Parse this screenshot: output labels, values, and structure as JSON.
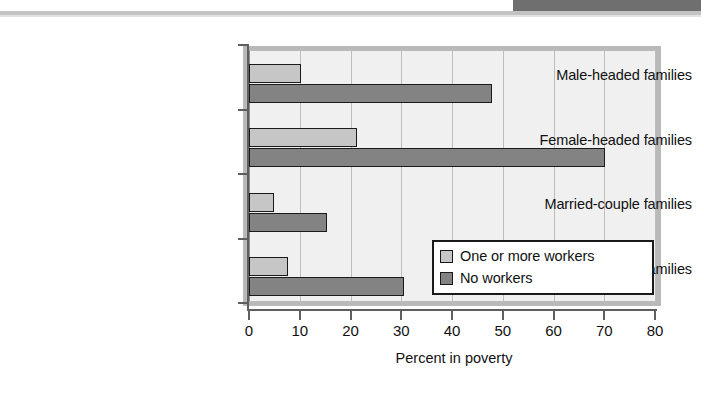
{
  "decor": {
    "top_band_color": "#6f6f6f",
    "rule_color": "#c3c3c3"
  },
  "chart_data": {
    "type": "bar",
    "orientation": "horizontal",
    "title": "",
    "xlabel": "Percent in poverty",
    "ylabel": "",
    "xlim": [
      0,
      80
    ],
    "xticks": [
      0,
      10,
      20,
      30,
      40,
      50,
      60,
      70,
      80
    ],
    "xtick_labels": [
      "0",
      "10",
      "20",
      "30",
      "40",
      "50",
      "60",
      "70",
      "80"
    ],
    "grid": true,
    "grid_axis": "x",
    "legend_position": "lower right",
    "categories": [
      "Male-headed families",
      "Female-headed families",
      "Married-couple families",
      "All families"
    ],
    "series": [
      {
        "name": "One or more workers",
        "color": "#c6c6c6",
        "values": [
          10.3,
          21.3,
          4.9,
          7.7
        ]
      },
      {
        "name": "No workers",
        "color": "#838383",
        "values": [
          47.9,
          70.1,
          15.4,
          30.5
        ]
      }
    ]
  },
  "legend": {
    "entries": [
      {
        "label": "One or more workers",
        "swatch": "light"
      },
      {
        "label": "No workers",
        "swatch": "dark"
      }
    ]
  }
}
